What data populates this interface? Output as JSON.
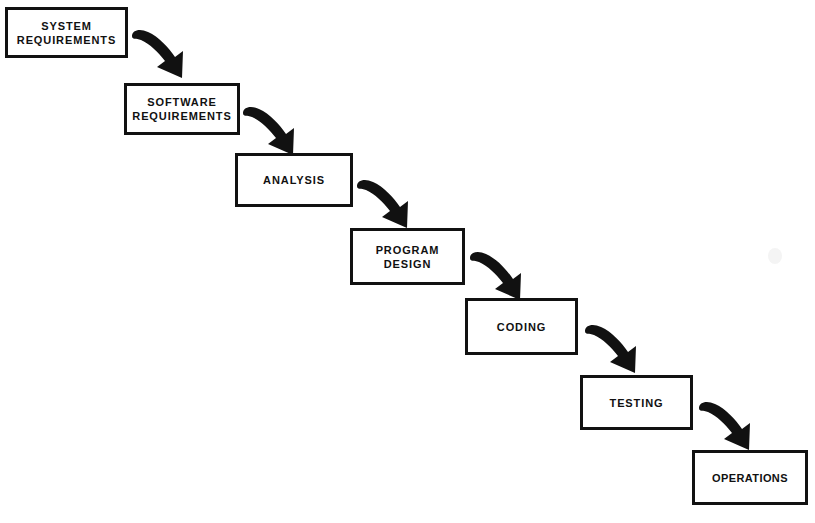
{
  "diagram": {
    "type": "flowchart",
    "orientation": "top-left-to-bottom-right cascade",
    "background_color": "#ffffff",
    "line_color": "#111111",
    "stages": [
      {
        "id": "system-requirements",
        "label": "SYSTEM\nREQUIREMENTS",
        "order": 1,
        "x": 5,
        "y": 7,
        "width": 123,
        "height": 51
      },
      {
        "id": "software-requirements",
        "label": "SOFTWARE\nREQUIREMENTS",
        "order": 2,
        "x": 124,
        "y": 83,
        "width": 116,
        "height": 52
      },
      {
        "id": "analysis",
        "label": "ANALYSIS",
        "order": 3,
        "x": 235,
        "y": 153,
        "width": 118,
        "height": 54
      },
      {
        "id": "program-design",
        "label": "PROGRAM\nDESIGN",
        "order": 4,
        "x": 350,
        "y": 228,
        "width": 115,
        "height": 57
      },
      {
        "id": "coding",
        "label": "CODING",
        "order": 5,
        "x": 465,
        "y": 298,
        "width": 113,
        "height": 57
      },
      {
        "id": "testing",
        "label": "TESTING",
        "order": 6,
        "x": 580,
        "y": 375,
        "width": 113,
        "height": 55
      },
      {
        "id": "operations",
        "label": "OPERATIONS",
        "order": 7,
        "x": 692,
        "y": 450,
        "width": 116,
        "height": 55
      }
    ],
    "connectors": [
      {
        "id": "arrow-1",
        "from": "system-requirements",
        "to": "software-requirements",
        "x": 130,
        "y": 30,
        "scale": 1.0
      },
      {
        "id": "arrow-2",
        "from": "software-requirements",
        "to": "analysis",
        "x": 241,
        "y": 107,
        "scale": 1.0
      },
      {
        "id": "arrow-3",
        "from": "analysis",
        "to": "program-design",
        "x": 355,
        "y": 180,
        "scale": 1.0
      },
      {
        "id": "arrow-4",
        "from": "program-design",
        "to": "coding",
        "x": 468,
        "y": 252,
        "scale": 1.0
      },
      {
        "id": "arrow-5",
        "from": "coding",
        "to": "testing",
        "x": 583,
        "y": 325,
        "scale": 1.0
      },
      {
        "id": "arrow-6",
        "from": "testing",
        "to": "operations",
        "x": 697,
        "y": 402,
        "scale": 1.0
      }
    ]
  }
}
